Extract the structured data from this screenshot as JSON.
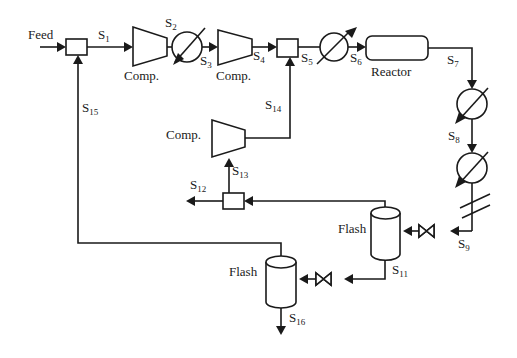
{
  "diagram": {
    "type": "process-flow-diagram",
    "feed_label": "Feed",
    "units": {
      "comp1": "Comp.",
      "comp2": "Comp.",
      "comp3": "Comp.",
      "reactor": "Reactor",
      "flash1": "Flash",
      "flash2": "Flash"
    },
    "streams": {
      "s1": {
        "main": "S",
        "sub": "1"
      },
      "s2": {
        "main": "S",
        "sub": "2"
      },
      "s3": {
        "main": "S",
        "sub": "3"
      },
      "s4": {
        "main": "S",
        "sub": "4"
      },
      "s5": {
        "main": "S",
        "sub": "5"
      },
      "s6": {
        "main": "S",
        "sub": "6"
      },
      "s7": {
        "main": "S",
        "sub": "7"
      },
      "s8": {
        "main": "S",
        "sub": "8"
      },
      "s9": {
        "main": "S",
        "sub": "9"
      },
      "s11": {
        "main": "S",
        "sub": "11"
      },
      "s12": {
        "main": "S",
        "sub": "12"
      },
      "s13": {
        "main": "S",
        "sub": "13"
      },
      "s14": {
        "main": "S",
        "sub": "14"
      },
      "s15": {
        "main": "S",
        "sub": "15"
      },
      "s16": {
        "main": "S",
        "sub": "16"
      }
    }
  }
}
